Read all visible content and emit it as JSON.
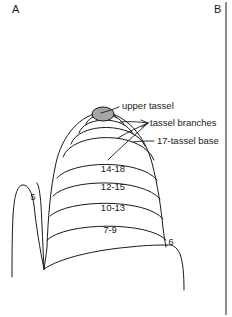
{
  "figure": {
    "panels": [
      {
        "id": "panel-a",
        "letter": "A",
        "x": 12,
        "y": 13
      },
      {
        "id": "panel-b",
        "letter": "B",
        "x": 214,
        "y": 13
      }
    ],
    "divider": {
      "x": 226,
      "y1": 2,
      "y2": 315,
      "color": "#1a1a1a"
    },
    "colors": {
      "ink": "#1a1a1a",
      "tassel_fill": "#a6a6a6",
      "background": "#ffffff"
    },
    "annotations": [
      {
        "name": "upper-tassel",
        "label": "upper tassel",
        "x": 122,
        "y": 109
      },
      {
        "name": "tassel-branches",
        "label": "tassel branches",
        "x": 150,
        "y": 126
      },
      {
        "name": "seventeen-tassel-base",
        "label": "17-tassel base",
        "x": 157,
        "y": 144
      }
    ],
    "band_labels": [
      {
        "name": "band-14-18",
        "label": "14-18",
        "x": 113,
        "y": 172
      },
      {
        "name": "band-12-15",
        "label": "12-15",
        "x": 113,
        "y": 190
      },
      {
        "name": "band-10-13",
        "label": "10-13",
        "x": 113,
        "y": 211
      },
      {
        "name": "band-7-9",
        "label": "7-9",
        "x": 110,
        "y": 233
      }
    ],
    "part_numbers": [
      {
        "name": "part-number-5",
        "label": "5",
        "x": 33,
        "y": 200
      },
      {
        "name": "part-number-6",
        "label": "6",
        "x": 171,
        "y": 245
      }
    ]
  }
}
